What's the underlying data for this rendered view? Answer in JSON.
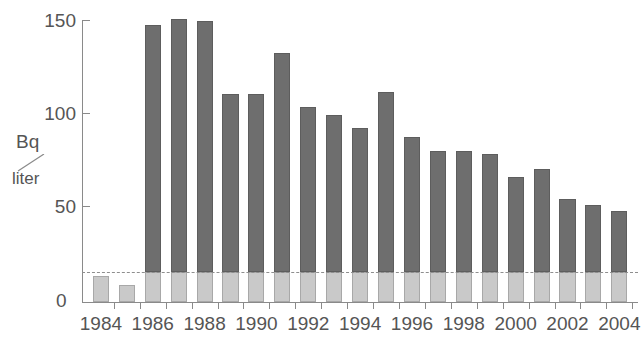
{
  "chart_data": {
    "type": "bar",
    "title": "",
    "xlabel": "",
    "ylabel": "Bq/liter",
    "ylabel_numerator": "Bq",
    "ylabel_denominator": "liter",
    "ylim": [
      0,
      158
    ],
    "xlim": [
      1983.5,
      2004.5
    ],
    "grid": false,
    "legend": "none",
    "y_ticks": [
      0,
      50,
      100,
      150
    ],
    "y_tick_labels": [
      "0",
      "50",
      "100",
      "150"
    ],
    "x_tick_labels": [
      "1984",
      "1986",
      "1988",
      "1990",
      "1992",
      "1994",
      "1996",
      "1998",
      "2000",
      "2002",
      "2004"
    ],
    "categories": [
      "1984",
      "1985",
      "1986",
      "1987",
      "1988",
      "1989",
      "1990",
      "1991",
      "1992",
      "1993",
      "1994",
      "1995",
      "1996",
      "1997",
      "1998",
      "1999",
      "2000",
      "2001",
      "2002",
      "2003",
      "2004"
    ],
    "values": [
      14,
      9,
      147,
      150,
      149,
      110,
      110,
      132,
      103,
      99,
      92,
      111,
      87,
      80,
      80,
      78,
      66,
      70,
      54,
      51,
      48
    ],
    "base_values": [
      14,
      9,
      16,
      16,
      16,
      16,
      16,
      16,
      16,
      16,
      16,
      16,
      16,
      16,
      16,
      16,
      16,
      16,
      16,
      16,
      16
    ],
    "series": [
      {
        "name": "natural background",
        "color": "#c9c9c9",
        "values": [
          14,
          9,
          16,
          16,
          16,
          16,
          16,
          16,
          16,
          16,
          16,
          16,
          16,
          16,
          16,
          16,
          16,
          16,
          16,
          16,
          16
        ]
      },
      {
        "name": "total activity",
        "color": "#6e6e6e",
        "values": [
          14,
          9,
          147,
          150,
          149,
          110,
          110,
          132,
          103,
          99,
          92,
          111,
          87,
          80,
          80,
          78,
          66,
          70,
          54,
          51,
          48
        ]
      }
    ],
    "reference_line": {
      "value": 16,
      "style": "dashed",
      "color": "#8e8e8e"
    },
    "colors": {
      "bar_dark": "#6e6e6e",
      "bar_light": "#c9c9c9",
      "axis": "#8a8a8a",
      "text": "#555555",
      "background": "#ffffff"
    }
  }
}
